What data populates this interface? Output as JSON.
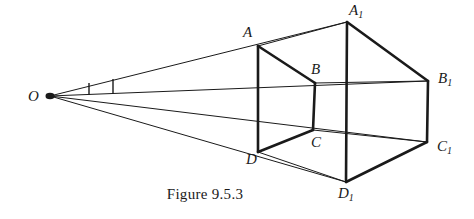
{
  "figure": {
    "caption": "Figure 9.5.3",
    "stroke_color": "#1a1a1a",
    "background_color": "#ffffff",
    "thick_stroke_width": 2.6,
    "thin_stroke_width": 1.0,
    "vertices": [
      {
        "id": "O",
        "label": "O",
        "sub": "",
        "x": 50,
        "y": 96,
        "label_x": 28,
        "label_y": 89
      },
      {
        "id": "A",
        "label": "A",
        "sub": "",
        "x": 258,
        "y": 46,
        "label_x": 243,
        "label_y": 25
      },
      {
        "id": "B",
        "label": "B",
        "sub": "",
        "x": 315,
        "y": 83,
        "label_x": 311,
        "label_y": 62
      },
      {
        "id": "C",
        "label": "C",
        "sub": "",
        "x": 313,
        "y": 130,
        "label_x": 311,
        "label_y": 135
      },
      {
        "id": "D",
        "label": "D",
        "sub": "",
        "x": 258,
        "y": 152,
        "label_x": 246,
        "label_y": 152
      },
      {
        "id": "A1",
        "label": "A",
        "sub": "1",
        "x": 347,
        "y": 22,
        "label_x": 349,
        "label_y": 3
      },
      {
        "id": "B1",
        "label": "B",
        "sub": "1",
        "x": 428,
        "y": 81,
        "label_x": 438,
        "label_y": 71
      },
      {
        "id": "C1",
        "label": "C",
        "sub": "1",
        "x": 427,
        "y": 142,
        "label_x": 437,
        "label_y": 139
      },
      {
        "id": "D1",
        "label": "D",
        "sub": "1",
        "x": 346,
        "y": 182,
        "label_x": 338,
        "label_y": 186
      }
    ],
    "thick_edges": [
      {
        "name": "edge-A-D",
        "from": "A",
        "to": "D"
      },
      {
        "name": "edge-A-B",
        "from": "A",
        "to": "B"
      },
      {
        "name": "edge-B-C",
        "from": "B",
        "to": "C"
      },
      {
        "name": "edge-C-D",
        "from": "C",
        "to": "D"
      },
      {
        "name": "edge-A1-D1",
        "from": "A1",
        "to": "D1"
      },
      {
        "name": "edge-A1-B1",
        "from": "A1",
        "to": "B1"
      },
      {
        "name": "edge-B1-C1",
        "from": "B1",
        "to": "C1"
      },
      {
        "name": "edge-C1-D1",
        "from": "C1",
        "to": "D1"
      }
    ],
    "thin_edges": [
      {
        "name": "ray-O-A1",
        "from": "O",
        "to": "A1"
      },
      {
        "name": "ray-O-B1",
        "from": "O",
        "to": "B1"
      },
      {
        "name": "ray-O-C1",
        "from": "O",
        "to": "C1"
      },
      {
        "name": "ray-O-D1",
        "from": "O",
        "to": "D1"
      },
      {
        "name": "edge-A-A1",
        "from": "A",
        "to": "A1"
      },
      {
        "name": "edge-B-B1",
        "from": "B",
        "to": "B1"
      },
      {
        "name": "edge-C-C1",
        "from": "C",
        "to": "C1"
      },
      {
        "name": "edge-D-D1",
        "from": "D",
        "to": "D1"
      }
    ],
    "angle_ticks": [
      {
        "name": "angle-tick-1",
        "x1": 89,
        "y1": 83,
        "x2": 89,
        "y2": 95
      },
      {
        "name": "angle-tick-2",
        "x1": 113,
        "y1": 79,
        "x2": 113,
        "y2": 94
      }
    ],
    "vertex_dot": {
      "name": "center-point-O",
      "x": 50,
      "y": 96,
      "rx": 4.5,
      "ry": 3.2
    }
  }
}
